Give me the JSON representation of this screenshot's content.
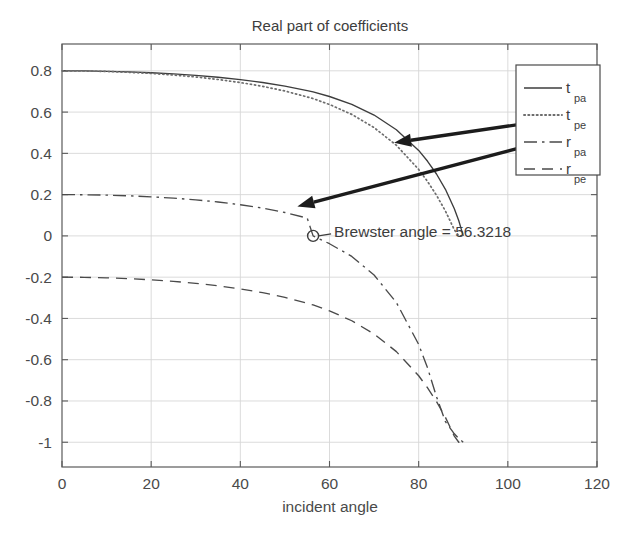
{
  "chart_data": {
    "type": "line",
    "title": "Real part of coefficients",
    "xlabel": "incident angle",
    "ylabel": "",
    "xlim": [
      0,
      120
    ],
    "ylim": [
      -1.12,
      0.93
    ],
    "xticks": [
      0,
      20,
      40,
      60,
      80,
      100,
      120
    ],
    "yticks": [
      0.8,
      0.6,
      0.4,
      0.2,
      0,
      -0.2,
      -0.4,
      -0.6,
      -0.8,
      -1
    ],
    "xtick_labels": [
      "0",
      "20",
      "40",
      "60",
      "80",
      "100",
      "120"
    ],
    "ytick_labels": [
      "0.8",
      "0.6",
      "0.4",
      "0.2",
      "0",
      "-0.2",
      "-0.4",
      "-0.6",
      "-0.8",
      "-1"
    ],
    "grid": true,
    "legend_position": "upper right",
    "refractive_index": 1.5,
    "x": [
      0,
      5,
      10,
      15,
      20,
      25,
      30,
      35,
      40,
      45,
      50,
      55,
      56.3218,
      60,
      65,
      70,
      75,
      80,
      82,
      84,
      86,
      88,
      89,
      90
    ],
    "series": [
      {
        "name": "t_pa",
        "label_main": "t",
        "label_sub": "pa",
        "style": "solid",
        "color": "#3d3d3d",
        "values": [
          0.8,
          0.7994,
          0.7977,
          0.7947,
          0.7905,
          0.7849,
          0.7777,
          0.7687,
          0.7575,
          0.7436,
          0.7262,
          0.7041,
          0.6979,
          0.6755,
          0.6374,
          0.5857,
          0.5146,
          0.4143,
          0.3616,
          0.3,
          0.2259,
          0.1316,
          0.0732,
          0.0
        ]
      },
      {
        "name": "t_pe",
        "label_main": "t",
        "label_sub": "pe",
        "style": "dotted",
        "color": "#6d6d6d",
        "values": [
          0.8,
          0.7992,
          0.7969,
          0.7929,
          0.7872,
          0.7797,
          0.7701,
          0.7581,
          0.7432,
          0.7249,
          0.7021,
          0.6735,
          0.6655,
          0.6369,
          0.5888,
          0.5248,
          0.4391,
          0.3222,
          0.2634,
          0.1969,
          0.1207,
          0.0297,
          0.0,
          0.0
        ]
      },
      {
        "name": "r_pa",
        "label_main": "r",
        "label_sub": "pa",
        "style": "dashdot",
        "color": "#4a4a4a",
        "values": [
          0.2,
          0.1994,
          0.1975,
          0.1943,
          0.1895,
          0.1831,
          0.1748,
          0.1643,
          0.1511,
          0.1345,
          0.1135,
          0.0862,
          0.0,
          -0.0379,
          -0.0996,
          -0.1896,
          -0.3231,
          -0.5261,
          -0.6402,
          -0.7793,
          -0.9004,
          -0.9593,
          -0.9819,
          -1.0
        ]
      },
      {
        "name": "r_pe",
        "label_main": "r",
        "label_sub": "pe",
        "style": "dashed",
        "color": "#4a4a4a",
        "values": [
          -0.2,
          -0.2008,
          -0.2031,
          -0.2071,
          -0.2128,
          -0.2203,
          -0.2299,
          -0.2419,
          -0.2568,
          -0.2751,
          -0.2979,
          -0.3265,
          -0.3345,
          -0.3631,
          -0.4112,
          -0.4752,
          -0.5609,
          -0.6778,
          -0.7366,
          -0.8031,
          -0.8793,
          -0.9703,
          -1.0,
          -1.0
        ]
      }
    ],
    "annotations": [
      {
        "name": "brewster-annotation",
        "text": "Brewster angle = 56.3218",
        "value": 56.3218,
        "marker": "circle",
        "marker_x": 56.3218,
        "marker_y": 0.0
      }
    ],
    "arrows": [
      {
        "name": "arrow-upper",
        "from_x": 104.2,
        "from_y": 0.545,
        "to_x": 74.5,
        "to_y": 0.452
      },
      {
        "name": "arrow-lower",
        "from_x": 104.2,
        "from_y": 0.435,
        "to_x": 52.8,
        "to_y": 0.143
      }
    ]
  },
  "legend": {
    "entries": [
      "t_pa",
      "t_pe",
      "r_pa",
      "r_pe"
    ]
  }
}
